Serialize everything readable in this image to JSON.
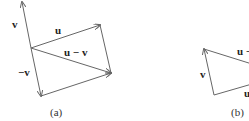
{
  "figure_a": {
    "caption": "(a)",
    "labels": {
      "v": "v",
      "u": "u",
      "u_minus_v": "u − v",
      "neg_v": "−v"
    }
  },
  "figure_b": {
    "caption": "(b)",
    "labels": {
      "u_minus_v_partial": "u −",
      "v": "v",
      "u_partial": "u"
    }
  },
  "colors": {
    "line": "#666666",
    "text": "#222222"
  }
}
